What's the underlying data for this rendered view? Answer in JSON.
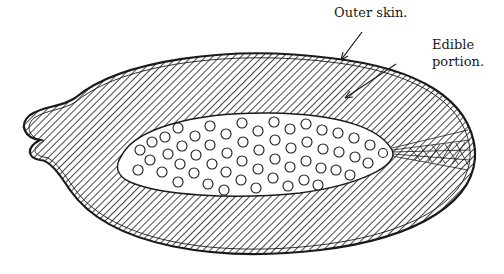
{
  "figure": {
    "labels": {
      "outer_skin": "Outer skin.",
      "edible_line1": "Edible",
      "edible_line2": "portion."
    },
    "colors": {
      "ink": "#1a1a1a",
      "paper": "#ffffff"
    }
  }
}
